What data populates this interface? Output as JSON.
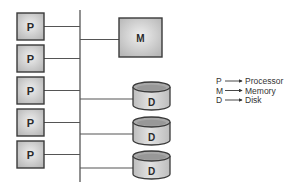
{
  "diagram": {
    "type": "shared-bus architecture",
    "bus": {
      "x": 80,
      "y_top": 10,
      "y_bottom": 182
    },
    "processors": [
      {
        "label": "P",
        "x": 17,
        "y": 13,
        "w": 27,
        "h": 27
      },
      {
        "label": "P",
        "x": 17,
        "y": 45,
        "w": 27,
        "h": 27
      },
      {
        "label": "P",
        "x": 17,
        "y": 77,
        "w": 27,
        "h": 27
      },
      {
        "label": "P",
        "x": 17,
        "y": 109,
        "w": 27,
        "h": 27
      },
      {
        "label": "P",
        "x": 17,
        "y": 141,
        "w": 27,
        "h": 27
      }
    ],
    "memory": {
      "label": "M",
      "x": 119,
      "y": 18,
      "w": 43,
      "h": 39
    },
    "disks": [
      {
        "label": "D",
        "x": 133,
        "y": 82,
        "w": 37,
        "h": 28
      },
      {
        "label": "D",
        "x": 133,
        "y": 117,
        "w": 37,
        "h": 28
      },
      {
        "label": "D",
        "x": 133,
        "y": 151,
        "w": 37,
        "h": 28
      }
    ],
    "legend": [
      {
        "symbol": "P",
        "meaning": "Processor"
      },
      {
        "symbol": "M",
        "meaning": "Memory"
      },
      {
        "symbol": "D",
        "meaning": "Disk"
      }
    ],
    "colors": {
      "box_fill": "#c9c9c9",
      "box_inner": "#e6e6e6",
      "stroke": "#3a3a3a",
      "line": "#555555"
    }
  }
}
